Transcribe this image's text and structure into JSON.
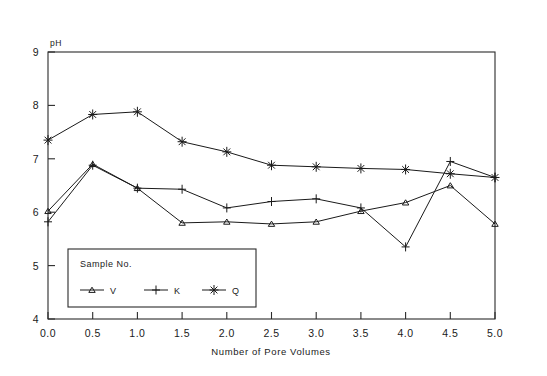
{
  "chart_data": {
    "type": "line",
    "title": "",
    "xlabel": "Number of Pore Volumes",
    "ylabel": "pH",
    "ylabel_position": "top-left",
    "xlim": [
      0.0,
      5.0
    ],
    "ylim": [
      4,
      9
    ],
    "grid": false,
    "legend_position": "inside-bottom-left",
    "legend_title": "Sample No.",
    "x": [
      0.0,
      0.5,
      1.0,
      1.5,
      2.0,
      2.5,
      3.0,
      3.5,
      4.0,
      4.5,
      5.0
    ],
    "xticklabels": [
      "0.0",
      "0.5",
      "1.0",
      "1.5",
      "2.0",
      "2.5",
      "3.0",
      "3.5",
      "4.0",
      "4.5",
      "5.0"
    ],
    "yticklabels": [
      "4",
      "5",
      "6",
      "7",
      "8",
      "9"
    ],
    "yticks": [
      4,
      5,
      6,
      7,
      8,
      9
    ],
    "series": [
      {
        "name": "V",
        "marker": "triangle",
        "values": [
          6.02,
          6.9,
          6.45,
          5.8,
          5.82,
          5.78,
          5.82,
          6.02,
          6.18,
          6.5,
          5.78
        ]
      },
      {
        "name": "K",
        "marker": "plus",
        "values": [
          5.82,
          6.88,
          6.45,
          6.43,
          6.08,
          6.2,
          6.25,
          6.08,
          5.35,
          6.95,
          6.65
        ]
      },
      {
        "name": "Q",
        "marker": "asterisk",
        "values": [
          7.35,
          7.83,
          7.88,
          7.32,
          7.13,
          6.88,
          6.85,
          6.82,
          6.8,
          6.72,
          6.65
        ]
      }
    ]
  },
  "legend": {
    "title": "Sample No.",
    "entries": [
      {
        "label": "V",
        "marker": "triangle"
      },
      {
        "label": "K",
        "marker": "plus"
      },
      {
        "label": "Q",
        "marker": "asterisk"
      }
    ]
  },
  "axes": {
    "y_unit_label": "pH",
    "x_axis_title": "Number of Pore Volumes"
  }
}
